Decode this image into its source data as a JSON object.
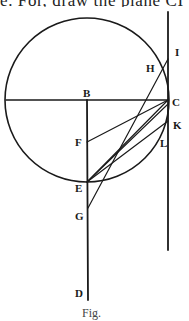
{
  "text": {
    "top_fragment": "e.  For, draw the plane CI",
    "caption_fragment": "Fig."
  },
  "labels": {
    "B": "B",
    "C": "C",
    "D": "D",
    "E": "E",
    "F": "F",
    "G": "G",
    "H": "H",
    "I": "I",
    "K": "K",
    "L": "L"
  },
  "colors": {
    "ink": "#1a1a1a",
    "paper": "#ffffff"
  }
}
